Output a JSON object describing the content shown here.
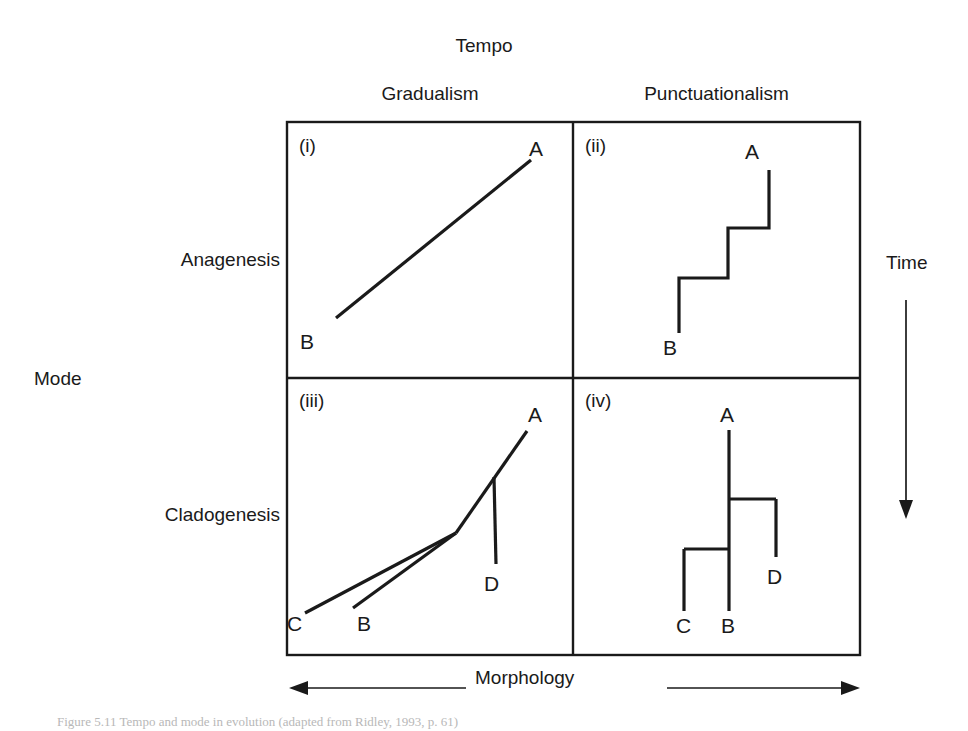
{
  "figure": {
    "axes": {
      "top_title": "Tempo",
      "left_title": "Mode",
      "right_title": "Time",
      "bottom_title": "Morphology",
      "time_direction": "downward",
      "morphology_direction": "bidirectional"
    },
    "columns": [
      {
        "label": "Gradualism"
      },
      {
        "label": "Punctuationalism"
      }
    ],
    "rows": [
      {
        "label": "Anagenesis"
      },
      {
        "label": "Cladogenesis"
      }
    ],
    "panels": [
      {
        "tag": "(i)",
        "tempo": "Gradualism",
        "mode": "Anagenesis",
        "taxa": [
          "A",
          "B"
        ],
        "pattern": "single straight sloping lineage from B to A"
      },
      {
        "tag": "(ii)",
        "tempo": "Punctuationalism",
        "mode": "Anagenesis",
        "taxa": [
          "A",
          "B"
        ],
        "pattern": "stepped staircase lineage from B to A"
      },
      {
        "tag": "(iii)",
        "tempo": "Gradualism",
        "mode": "Cladogenesis",
        "taxa": [
          "A",
          "B",
          "C",
          "D"
        ],
        "pattern": "sloping branching tree, C and B diverge low, D diverges high, lineage continues to A"
      },
      {
        "tag": "(iv)",
        "tempo": "Punctuationalism",
        "mode": "Cladogenesis",
        "taxa": [
          "A",
          "B",
          "C",
          "D"
        ],
        "pattern": "rectangular cladogram, vertical stem B to A with right-angle branches to C and D"
      }
    ],
    "colors": {
      "ink": "#1a1a1a",
      "background": "#ffffff"
    }
  },
  "caption": {
    "text": "Figure 5.11  Tempo and mode in evolution (adapted from Ridley, 1993, p. 61)"
  }
}
